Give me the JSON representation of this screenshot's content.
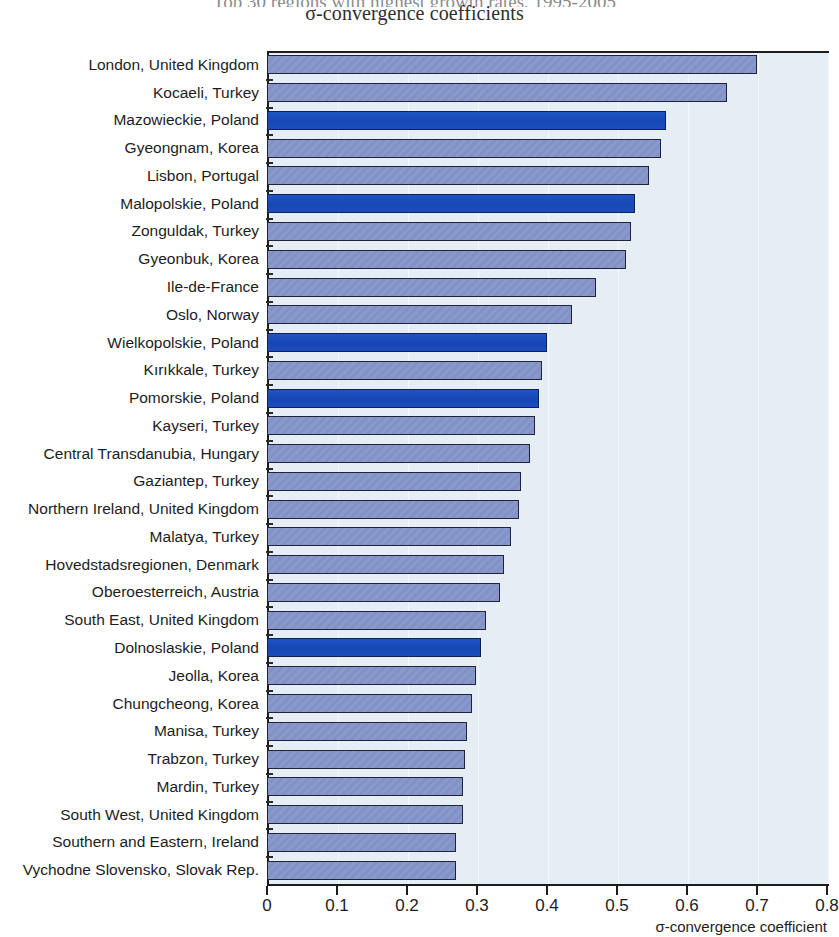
{
  "header": {
    "title_clipped": "Top 30 regions with highest growth rates, 1995-2005",
    "subtitle": "σ-convergence coefficients"
  },
  "axis": {
    "x_title": "σ-convergence coefficient",
    "x_ticks": [
      "0",
      "0.1",
      "0.2",
      "0.3",
      "0.4",
      "0.5",
      "0.6",
      "0.7",
      "0.8"
    ],
    "x_min": 0,
    "x_max": 0.8
  },
  "colors": {
    "bar_default": "#8a99cc",
    "bar_highlight": "#1b4dbd",
    "plot_background": "#e6eef5",
    "axis": "#1d1d1d"
  },
  "chart_data": {
    "type": "bar",
    "orientation": "horizontal",
    "title": "Top 30 regions with highest growth rates, 1995-2005",
    "subtitle": "σ-convergence coefficients",
    "xlabel": "σ-convergence coefficient",
    "ylabel": "",
    "xlim": [
      0,
      0.8
    ],
    "grid": true,
    "legend": null,
    "categories": [
      "London, United Kingdom",
      "Kocaeli, Turkey",
      "Mazowieckie, Poland",
      "Gyeongnam, Korea",
      "Lisbon, Portugal",
      "Malopolskie, Poland",
      "Zonguldak, Turkey",
      "Gyeonbuk, Korea",
      "Ile-de-France",
      "Oslo, Norway",
      "Wielkopolskie, Poland",
      "Kırıkkale, Turkey",
      "Pomorskie, Poland",
      "Kayseri, Turkey",
      "Central Transdanubia, Hungary",
      "Gaziantep, Turkey",
      "Northern Ireland, United Kingdom",
      "Malatya, Turkey",
      "Hovedstadsregionen, Denmark",
      "Oberoesterreich, Austria",
      "South East, United Kingdom",
      "Dolnoslaskie, Poland",
      "Jeolla, Korea",
      "Chungcheong, Korea",
      "Manisa, Turkey",
      "Trabzon, Turkey",
      "Mardin, Turkey",
      "South West, United Kingdom",
      "Southern and Eastern, Ireland",
      "Vychodne Slovensko, Slovak Rep."
    ],
    "values": [
      0.7,
      0.657,
      0.57,
      0.563,
      0.545,
      0.525,
      0.52,
      0.513,
      0.47,
      0.435,
      0.4,
      0.393,
      0.388,
      0.383,
      0.375,
      0.363,
      0.36,
      0.348,
      0.338,
      0.333,
      0.313,
      0.305,
      0.298,
      0.293,
      0.285,
      0.283,
      0.28,
      0.28,
      0.27,
      0.27
    ],
    "highlighted": [
      false,
      false,
      true,
      false,
      false,
      true,
      false,
      false,
      false,
      false,
      true,
      false,
      true,
      false,
      false,
      false,
      false,
      false,
      false,
      false,
      false,
      true,
      false,
      false,
      false,
      false,
      false,
      false,
      false,
      false
    ]
  }
}
